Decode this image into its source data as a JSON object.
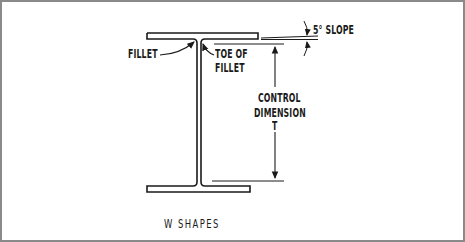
{
  "diagram": {
    "title": "W SHAPES",
    "labels": {
      "fillet": "FILLET",
      "toe_of_fillet_line1": "TOE OF",
      "toe_of_fillet_line2": "FILLET",
      "slope": "5° SLOPE",
      "control_dimension_line1": "CONTROL",
      "control_dimension_line2": "DIMENSION",
      "control_dimension_symbol": "T"
    },
    "colors": {
      "ink": "#1a1a1a",
      "border": "#8a8a8a",
      "background": "#ffffff"
    }
  }
}
